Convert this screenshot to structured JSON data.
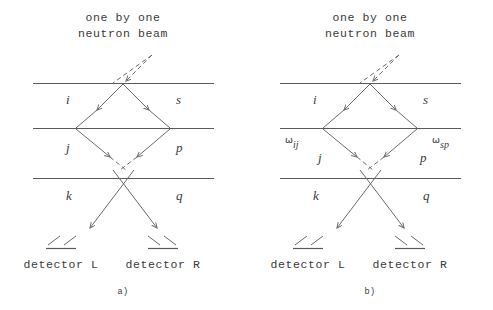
{
  "figure": {
    "caption_a": "a)",
    "caption_b": "b)",
    "background_color": "#ffffff",
    "ink_color": "#3a3a3a",
    "line_color": "#5a5a5a"
  },
  "panel_a": {
    "id": "a",
    "label": "a)",
    "source_title_line1": "one by one",
    "source_title_line2": "neutron beam",
    "crystal_count": 3,
    "path_labels": {
      "i": "i",
      "s": "s",
      "j": "j",
      "p": "p",
      "k": "k",
      "q": "q"
    },
    "detectors": {
      "left": "detector L",
      "right": "detector R"
    }
  },
  "panel_b": {
    "id": "b",
    "label": "b)",
    "source_title_line1": "one by one",
    "source_title_line2": "neutron beam",
    "crystal_count": 3,
    "path_labels": {
      "i": "i",
      "s": "s",
      "j": "j",
      "p": "p",
      "k": "k",
      "q": "q"
    },
    "phase_labels": {
      "omega_left_base": "ω",
      "omega_left_sub": "ij",
      "omega_right_base": "ω",
      "omega_right_sub": "sp"
    },
    "detectors": {
      "left": "detector L",
      "right": "detector R"
    }
  }
}
